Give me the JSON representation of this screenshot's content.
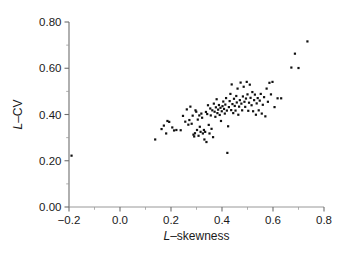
{
  "chart_data": {
    "type": "scatter",
    "title": "",
    "xlabel": "L-skewness",
    "ylabel": "L-CV",
    "xlabel_parts": {
      "prefix": "L",
      "dash": "–",
      "suffix": "skewness"
    },
    "ylabel_parts": {
      "prefix": "L",
      "dash": "–",
      "suffix": "CV"
    },
    "xlim": [
      -0.2,
      0.8
    ],
    "ylim": [
      0.0,
      0.8
    ],
    "xticks": [
      -0.2,
      0.0,
      0.2,
      0.4,
      0.6,
      0.8
    ],
    "yticks": [
      0.0,
      0.2,
      0.4,
      0.6,
      0.8
    ],
    "xticklabels": [
      "−0.2",
      "0.0",
      "0.2",
      "0.4",
      "0.6",
      "0.8"
    ],
    "yticklabels": [
      "0.00",
      "0.20",
      "0.40",
      "0.60",
      "0.80"
    ],
    "xminor_step": 0.1,
    "yminor_step": 0.1,
    "grid": false,
    "legend": null,
    "marker": {
      "shape": "square",
      "size_px": 2.2,
      "color": "#111111"
    },
    "n_points": 121,
    "points": [
      [
        -0.19,
        0.222
      ],
      [
        0.138,
        0.292
      ],
      [
        0.163,
        0.337
      ],
      [
        0.172,
        0.352
      ],
      [
        0.181,
        0.318
      ],
      [
        0.186,
        0.372
      ],
      [
        0.193,
        0.368
      ],
      [
        0.205,
        0.344
      ],
      [
        0.212,
        0.331
      ],
      [
        0.221,
        0.333
      ],
      [
        0.238,
        0.332
      ],
      [
        0.247,
        0.394
      ],
      [
        0.256,
        0.369
      ],
      [
        0.262,
        0.422
      ],
      [
        0.268,
        0.356
      ],
      [
        0.272,
        0.376
      ],
      [
        0.276,
        0.434
      ],
      [
        0.281,
        0.36
      ],
      [
        0.285,
        0.395
      ],
      [
        0.288,
        0.313
      ],
      [
        0.291,
        0.305
      ],
      [
        0.294,
        0.319
      ],
      [
        0.296,
        0.418
      ],
      [
        0.299,
        0.412
      ],
      [
        0.302,
        0.333
      ],
      [
        0.305,
        0.378
      ],
      [
        0.308,
        0.308
      ],
      [
        0.311,
        0.396
      ],
      [
        0.313,
        0.347
      ],
      [
        0.316,
        0.325
      ],
      [
        0.319,
        0.404
      ],
      [
        0.322,
        0.386
      ],
      [
        0.325,
        0.318
      ],
      [
        0.329,
        0.333
      ],
      [
        0.331,
        0.292
      ],
      [
        0.334,
        0.325
      ],
      [
        0.337,
        0.411
      ],
      [
        0.339,
        0.281
      ],
      [
        0.342,
        0.402
      ],
      [
        0.345,
        0.44
      ],
      [
        0.348,
        0.355
      ],
      [
        0.351,
        0.318
      ],
      [
        0.354,
        0.426
      ],
      [
        0.356,
        0.396
      ],
      [
        0.359,
        0.338
      ],
      [
        0.362,
        0.418
      ],
      [
        0.365,
        0.302
      ],
      [
        0.368,
        0.447
      ],
      [
        0.371,
        0.412
      ],
      [
        0.374,
        0.39
      ],
      [
        0.376,
        0.431
      ],
      [
        0.379,
        0.466
      ],
      [
        0.382,
        0.406
      ],
      [
        0.385,
        0.421
      ],
      [
        0.388,
        0.441
      ],
      [
        0.391,
        0.398
      ],
      [
        0.394,
        0.429
      ],
      [
        0.396,
        0.372
      ],
      [
        0.399,
        0.414
      ],
      [
        0.402,
        0.436
      ],
      [
        0.405,
        0.456
      ],
      [
        0.408,
        0.424
      ],
      [
        0.411,
        0.404
      ],
      [
        0.413,
        0.443
      ],
      [
        0.416,
        0.471
      ],
      [
        0.419,
        0.417
      ],
      [
        0.421,
        0.234
      ],
      [
        0.424,
        0.349
      ],
      [
        0.427,
        0.432
      ],
      [
        0.43,
        0.458
      ],
      [
        0.433,
        0.489
      ],
      [
        0.436,
        0.419
      ],
      [
        0.438,
        0.53
      ],
      [
        0.441,
        0.445
      ],
      [
        0.444,
        0.406
      ],
      [
        0.447,
        0.468
      ],
      [
        0.45,
        0.437
      ],
      [
        0.453,
        0.417
      ],
      [
        0.456,
        0.48
      ],
      [
        0.458,
        0.452
      ],
      [
        0.461,
        0.512
      ],
      [
        0.464,
        0.399
      ],
      [
        0.467,
        0.434
      ],
      [
        0.47,
        0.462
      ],
      [
        0.473,
        0.538
      ],
      [
        0.476,
        0.447
      ],
      [
        0.479,
        0.418
      ],
      [
        0.482,
        0.478
      ],
      [
        0.485,
        0.52
      ],
      [
        0.488,
        0.455
      ],
      [
        0.491,
        0.433
      ],
      [
        0.494,
        0.469
      ],
      [
        0.497,
        0.541
      ],
      [
        0.5,
        0.487
      ],
      [
        0.503,
        0.416
      ],
      [
        0.506,
        0.451
      ],
      [
        0.509,
        0.529
      ],
      [
        0.512,
        0.472
      ],
      [
        0.516,
        0.44
      ],
      [
        0.519,
        0.497
      ],
      [
        0.522,
        0.414
      ],
      [
        0.526,
        0.462
      ],
      [
        0.529,
        0.486
      ],
      [
        0.533,
        0.399
      ],
      [
        0.536,
        0.448
      ],
      [
        0.54,
        0.471
      ],
      [
        0.544,
        0.418
      ],
      [
        0.548,
        0.46
      ],
      [
        0.552,
        0.489
      ],
      [
        0.556,
        0.404
      ],
      [
        0.56,
        0.442
      ],
      [
        0.565,
        0.475
      ],
      [
        0.57,
        0.392
      ],
      [
        0.575,
        0.512
      ],
      [
        0.58,
        0.455
      ],
      [
        0.586,
        0.537
      ],
      [
        0.592,
        0.487
      ],
      [
        0.598,
        0.541
      ],
      [
        0.606,
        0.432
      ],
      [
        0.618,
        0.47
      ],
      [
        0.632,
        0.47
      ],
      [
        0.672,
        0.603
      ],
      [
        0.686,
        0.663
      ],
      [
        0.7,
        0.601
      ],
      [
        0.735,
        0.716
      ]
    ]
  },
  "plot_geometry": {
    "left_px": 69,
    "right_px": 324,
    "top_px": 22,
    "bottom_px": 207
  }
}
